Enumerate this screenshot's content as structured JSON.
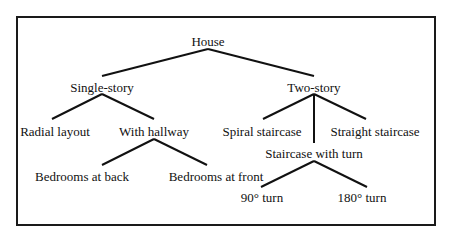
{
  "diagram": {
    "type": "tree",
    "root": "House",
    "nodes": [
      {
        "id": "house",
        "label": "House",
        "x": 208,
        "y": 35
      },
      {
        "id": "single",
        "label": "Single-story",
        "x": 102,
        "y": 81
      },
      {
        "id": "two",
        "label": "Two-story",
        "x": 314,
        "y": 81
      },
      {
        "id": "radial",
        "label": "Radial layout",
        "x": 55,
        "y": 125
      },
      {
        "id": "hallway",
        "label": "With hallway",
        "x": 154,
        "y": 125
      },
      {
        "id": "spiral",
        "label": "Spiral staircase",
        "x": 262,
        "y": 125
      },
      {
        "id": "straight",
        "label": "Straight staircase",
        "x": 375,
        "y": 125
      },
      {
        "id": "back",
        "label": "Bedrooms at back",
        "x": 82,
        "y": 170
      },
      {
        "id": "front",
        "label": "Bedrooms at front",
        "x": 216,
        "y": 170
      },
      {
        "id": "turn",
        "label": "Staircase with turn",
        "x": 314,
        "y": 147
      },
      {
        "id": "t90",
        "label": "90° turn",
        "x": 262,
        "y": 191
      },
      {
        "id": "t180",
        "label": "180° turn",
        "x": 362,
        "y": 191
      }
    ],
    "edges": [
      {
        "from": "house",
        "to": "single",
        "x1": 208,
        "y1": 49,
        "x2": 102,
        "y2": 76
      },
      {
        "from": "house",
        "to": "two",
        "x1": 208,
        "y1": 49,
        "x2": 314,
        "y2": 76
      },
      {
        "from": "single",
        "to": "radial",
        "x1": 102,
        "y1": 94,
        "x2": 52,
        "y2": 119
      },
      {
        "from": "single",
        "to": "hallway",
        "x1": 102,
        "y1": 94,
        "x2": 154,
        "y2": 119
      },
      {
        "from": "two",
        "to": "spiral",
        "x1": 314,
        "y1": 94,
        "x2": 263,
        "y2": 119
      },
      {
        "from": "two",
        "to": "turn",
        "x1": 314,
        "y1": 94,
        "x2": 314,
        "y2": 143
      },
      {
        "from": "two",
        "to": "straight",
        "x1": 314,
        "y1": 94,
        "x2": 366,
        "y2": 119
      },
      {
        "from": "hallway",
        "to": "back",
        "x1": 154,
        "y1": 139,
        "x2": 102,
        "y2": 165
      },
      {
        "from": "hallway",
        "to": "front",
        "x1": 154,
        "y1": 139,
        "x2": 207,
        "y2": 165
      },
      {
        "from": "turn",
        "to": "t90",
        "x1": 314,
        "y1": 161,
        "x2": 261,
        "y2": 187
      },
      {
        "from": "turn",
        "to": "t180",
        "x1": 314,
        "y1": 161,
        "x2": 367,
        "y2": 187
      }
    ]
  }
}
